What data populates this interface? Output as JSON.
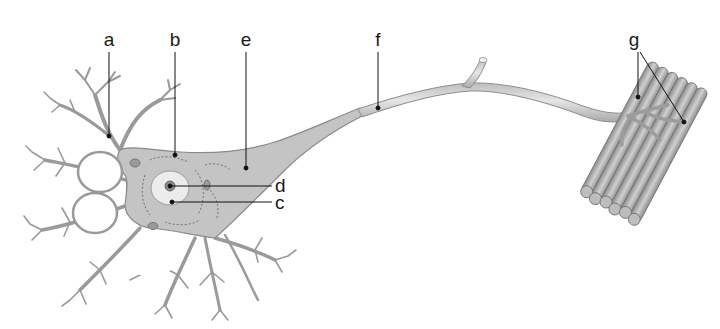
{
  "diagram": {
    "labels": [
      {
        "id": "a",
        "text": "a",
        "x": 109,
        "y": 28,
        "target": "dendrite"
      },
      {
        "id": "b",
        "text": "b",
        "x": 175,
        "y": 28,
        "target": "cell body"
      },
      {
        "id": "e",
        "text": "e",
        "x": 245,
        "y": 28,
        "target": "axon hillock"
      },
      {
        "id": "f",
        "text": "f",
        "x": 378,
        "y": 28,
        "target": "axon"
      },
      {
        "id": "g",
        "text": "g",
        "x": 633,
        "y": 28,
        "target": "axon terminals / neuromuscular junction"
      },
      {
        "id": "d",
        "text": "d",
        "x": 276,
        "y": 176,
        "target": "nucleolus"
      },
      {
        "id": "c",
        "text": "c",
        "x": 276,
        "y": 192,
        "target": "nucleus"
      }
    ],
    "colors": {
      "cell_fill": "#c9c9c9",
      "cell_stroke": "#8a8a8a",
      "axon_fill": "#d8d8d8",
      "muscle_fill": "#a8a8a8",
      "leader_line": "#111111",
      "background": "#ffffff"
    }
  }
}
